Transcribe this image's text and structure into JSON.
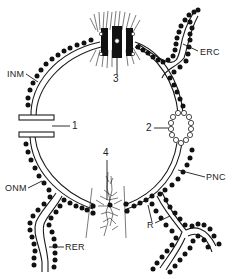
{
  "diagram": {
    "colors": {
      "line": "#1a1a1a",
      "ribosome": "#111111",
      "background": "#ffffff"
    },
    "labels": {
      "inm": "INM",
      "onm": "ONM",
      "erc": "ERC",
      "pnc": "PNC",
      "rer": "RER",
      "r": "R",
      "n1": "1",
      "n2": "2",
      "n3": "3",
      "n4": "4"
    },
    "parts": [
      {
        "id": "INM",
        "meaning": "inner nuclear membrane"
      },
      {
        "id": "ONM",
        "meaning": "outer nuclear membrane"
      },
      {
        "id": "PNC",
        "meaning": "perinuclear cisterna"
      },
      {
        "id": "ERC",
        "meaning": "endoplasmic reticulum continuity"
      },
      {
        "id": "RER",
        "meaning": "rough endoplasmic reticulum"
      },
      {
        "id": "R",
        "meaning": "ribosomes"
      },
      {
        "id": "1",
        "meaning": "open gap in envelope"
      },
      {
        "id": "2",
        "meaning": "ring-shaped pore complex"
      },
      {
        "id": "3",
        "meaning": "pore complex with fibrillar material"
      },
      {
        "id": "4",
        "meaning": "pore complex with filaments"
      }
    ]
  }
}
